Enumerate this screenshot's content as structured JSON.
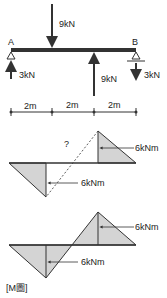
{
  "beam": {
    "support_a_label": "A",
    "support_b_label": "B",
    "load_down_label": "9kN",
    "load_up_label": "9kN",
    "reaction_a_label": "3kN",
    "reaction_b_label": "3kN"
  },
  "dimensions": {
    "segments": [
      "2m",
      "2m",
      "2m"
    ]
  },
  "moment_diagram_1": {
    "question_mark": "?",
    "top_label": "6kNm",
    "bottom_label": "6kNm"
  },
  "moment_diagram_2": {
    "top_label": "6kNm",
    "bottom_label": "6kNm"
  },
  "caption": "[M圖]",
  "colors": {
    "fill": "#d4d4d4",
    "stroke": "#333333",
    "beam": "#333333"
  }
}
